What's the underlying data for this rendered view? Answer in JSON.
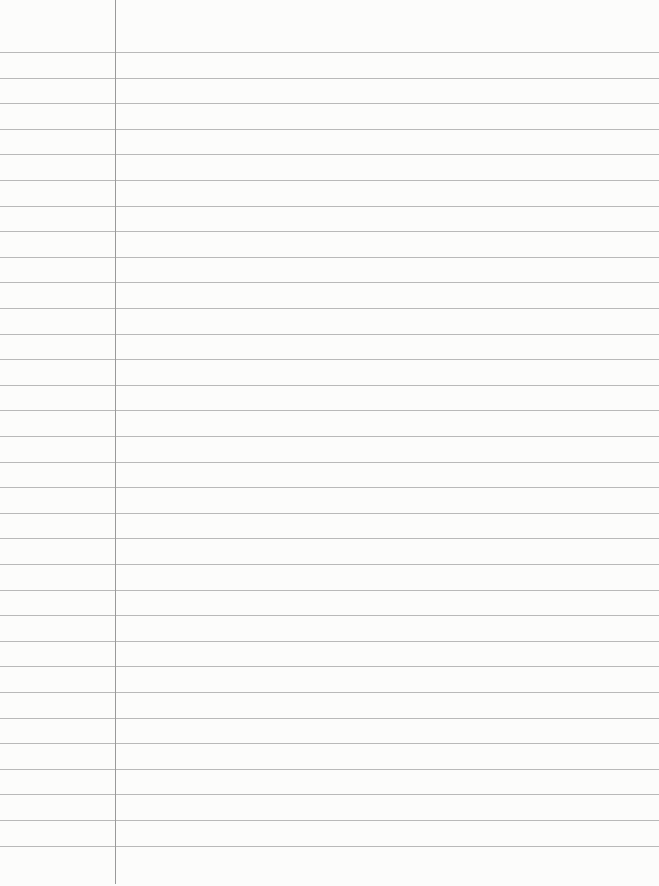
{
  "page": {
    "type": "lined-notebook-paper",
    "background_color": "#fcfcfb",
    "rule_color": "#b9b9b9",
    "margin_color": "#9a9a9a",
    "margin_x": 115,
    "first_rule_y": 52,
    "rule_spacing": 25.6,
    "rule_count": 32,
    "text": ""
  }
}
